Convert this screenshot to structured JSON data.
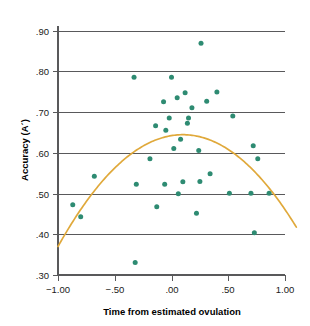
{
  "chart_data": {
    "type": "scatter",
    "title": "",
    "xlabel": "Time from estimated ovulation",
    "ylabel": "Accuracy (A´)",
    "xlim": [
      -1.12,
      1.12
    ],
    "ylim": [
      0.3,
      0.92
    ],
    "grid": "horizontal",
    "legend": "none",
    "xticks": [
      -1.0,
      -0.5,
      0.0,
      0.5,
      1.0
    ],
    "xticklabels": [
      "−1.00",
      "−.50",
      ".00",
      ".50",
      "1.00"
    ],
    "yticks": [
      0.3,
      0.4,
      0.5,
      0.6,
      0.7,
      0.8,
      0.9
    ],
    "yticklabels": [
      ".30",
      ".40",
      ".50",
      ".60",
      ".70",
      ".80",
      ".90"
    ],
    "marker_color": "#2e8b72",
    "marker_size": 5,
    "curve_color": "#e0a93b",
    "curve_label": "quadratic fit",
    "points": [
      {
        "x": -0.87,
        "y": 0.473
      },
      {
        "x": -0.8,
        "y": 0.443
      },
      {
        "x": -0.68,
        "y": 0.543
      },
      {
        "x": -0.33,
        "y": 0.786
      },
      {
        "x": -0.32,
        "y": 0.331
      },
      {
        "x": -0.31,
        "y": 0.523
      },
      {
        "x": -0.19,
        "y": 0.586
      },
      {
        "x": -0.14,
        "y": 0.667
      },
      {
        "x": -0.13,
        "y": 0.468
      },
      {
        "x": -0.07,
        "y": 0.726
      },
      {
        "x": -0.06,
        "y": 0.523
      },
      {
        "x": -0.05,
        "y": 0.656
      },
      {
        "x": -0.02,
        "y": 0.686
      },
      {
        "x": 0.0,
        "y": 0.786
      },
      {
        "x": 0.02,
        "y": 0.611
      },
      {
        "x": 0.05,
        "y": 0.736
      },
      {
        "x": 0.06,
        "y": 0.5
      },
      {
        "x": 0.08,
        "y": 0.634
      },
      {
        "x": 0.1,
        "y": 0.529
      },
      {
        "x": 0.12,
        "y": 0.748
      },
      {
        "x": 0.14,
        "y": 0.673
      },
      {
        "x": 0.15,
        "y": 0.686
      },
      {
        "x": 0.18,
        "y": 0.711
      },
      {
        "x": 0.22,
        "y": 0.452
      },
      {
        "x": 0.24,
        "y": 0.606
      },
      {
        "x": 0.25,
        "y": 0.53
      },
      {
        "x": 0.26,
        "y": 0.87
      },
      {
        "x": 0.31,
        "y": 0.727
      },
      {
        "x": 0.34,
        "y": 0.549
      },
      {
        "x": 0.4,
        "y": 0.75
      },
      {
        "x": 0.51,
        "y": 0.501
      },
      {
        "x": 0.54,
        "y": 0.691
      },
      {
        "x": 0.7,
        "y": 0.501
      },
      {
        "x": 0.72,
        "y": 0.618
      },
      {
        "x": 0.73,
        "y": 0.404
      },
      {
        "x": 0.76,
        "y": 0.586
      },
      {
        "x": 0.86,
        "y": 0.501
      }
    ],
    "curve": {
      "form": "quadratic",
      "vertex_x": 0.1,
      "vertex_y": 0.645,
      "endpoints": [
        {
          "x": -1.0,
          "y": 0.37
        },
        {
          "x": 1.1,
          "y": 0.412
        }
      ]
    }
  }
}
